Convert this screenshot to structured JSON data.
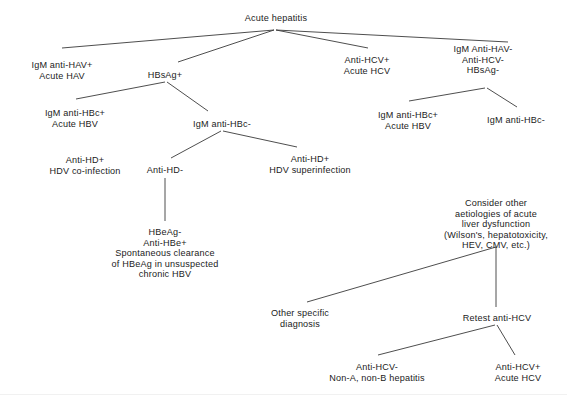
{
  "figure": {
    "line_color": "#3a3a3a",
    "text_color": "#1b1b1b",
    "background": "#ffffff"
  },
  "chart_data": {
    "type": "diagram",
    "subtype": "decision-tree",
    "title": "Acute hepatitis",
    "orientation": "top-down",
    "nodes": [
      {
        "id": "root",
        "label": "Acute hepatitis",
        "x": 276,
        "y": 13
      },
      {
        "id": "hav",
        "label": "IgM anti-HAV+\nAcute HAV",
        "x": 62,
        "y": 60
      },
      {
        "id": "hbsag_pos",
        "label": "HBsAg+",
        "x": 165,
        "y": 70
      },
      {
        "id": "hcv_pos",
        "label": "Anti-HCV+\nAcute HCV",
        "x": 367,
        "y": 55
      },
      {
        "id": "all_neg",
        "label": "IgM Anti-HAV-\nAnti-HCV-\nHBsAg-",
        "x": 483,
        "y": 44
      },
      {
        "id": "hbc_pos_left",
        "label": "IgM anti-HBc+\nAcute HBV",
        "x": 75,
        "y": 108
      },
      {
        "id": "hbc_neg_mid",
        "label": "IgM anti-HBc-",
        "x": 222,
        "y": 119
      },
      {
        "id": "hbc_pos_right",
        "label": "IgM anti-HBc+\nAcute HBV",
        "x": 408,
        "y": 110
      },
      {
        "id": "hbc_neg_right",
        "label": "IgM anti-HBc-",
        "x": 516,
        "y": 115
      },
      {
        "id": "hd_pos",
        "label": "Anti-HD+\nHDV co-infection",
        "x": 85,
        "y": 155
      },
      {
        "id": "hd_neg",
        "label": "Anti-HD-",
        "x": 165,
        "y": 165
      },
      {
        "id": "hd_super",
        "label": "Anti-HD+\nHDV superinfection",
        "x": 310,
        "y": 154
      },
      {
        "id": "hbeag",
        "label": "HBeAg-\nAnti-HBe+\nSpontaneous clearance\nof HBeAg in unsuspected\nchronic HBV",
        "x": 165,
        "y": 227
      },
      {
        "id": "consider_other",
        "label": "Consider other\naetiologies of acute\nliver dysfunction\n(Wilson's, hepatotoxicity,\nHEV, CMV, etc.)",
        "x": 496,
        "y": 198
      },
      {
        "id": "other_specific",
        "label": "Other specific\ndiagnosis",
        "x": 300,
        "y": 308
      },
      {
        "id": "retest_hcv",
        "label": "Retest anti-HCV",
        "x": 497,
        "y": 313
      },
      {
        "id": "hcv_neg_final",
        "label": "Anti-HCV-\nNon-A, non-B hepatitis",
        "x": 377,
        "y": 362
      },
      {
        "id": "hcv_pos_final",
        "label": "Anti-HCV+\nAcute HCV",
        "x": 518,
        "y": 362
      }
    ],
    "edges": [
      {
        "from": "root",
        "to": "hav",
        "x1": 274,
        "y1": 30,
        "x2": 62,
        "y2": 48
      },
      {
        "from": "root",
        "to": "hbsag_pos",
        "x1": 274,
        "y1": 30,
        "x2": 178,
        "y2": 62
      },
      {
        "from": "root",
        "to": "hcv_pos",
        "x1": 276,
        "y1": 30,
        "x2": 368,
        "y2": 48
      },
      {
        "from": "root",
        "to": "all_neg",
        "x1": 276,
        "y1": 30,
        "x2": 508,
        "y2": 42
      },
      {
        "from": "hbsag_pos",
        "to": "hbc_pos_left",
        "x1": 165,
        "y1": 82,
        "x2": 76,
        "y2": 99
      },
      {
        "from": "hbsag_pos",
        "to": "hbc_neg_mid",
        "x1": 167,
        "y1": 82,
        "x2": 208,
        "y2": 111
      },
      {
        "from": "all_neg",
        "to": "hbc_pos_right",
        "x1": 485,
        "y1": 88,
        "x2": 409,
        "y2": 101
      },
      {
        "from": "all_neg",
        "to": "hbc_neg_right",
        "x1": 487,
        "y1": 88,
        "x2": 517,
        "y2": 107
      },
      {
        "from": "hbc_neg_mid",
        "to": "hd_neg",
        "x1": 221,
        "y1": 131,
        "x2": 171,
        "y2": 158
      },
      {
        "from": "hbc_neg_mid",
        "to": "hd_super",
        "x1": 223,
        "y1": 131,
        "x2": 297,
        "y2": 147
      },
      {
        "from": "hd_neg",
        "to": "hbeag",
        "x1": 165,
        "y1": 178,
        "x2": 165,
        "y2": 221
      },
      {
        "from": "consider_other",
        "to": "other_specific",
        "x1": 496,
        "y1": 247,
        "x2": 307,
        "y2": 302
      },
      {
        "from": "consider_other",
        "to": "retest_hcv",
        "x1": 496,
        "y1": 247,
        "x2": 496,
        "y2": 307
      },
      {
        "from": "retest_hcv",
        "to": "hcv_neg_final",
        "x1": 495,
        "y1": 325,
        "x2": 378,
        "y2": 355
      },
      {
        "from": "retest_hcv",
        "to": "hcv_pos_final",
        "x1": 497,
        "y1": 325,
        "x2": 515,
        "y2": 355
      }
    ]
  }
}
